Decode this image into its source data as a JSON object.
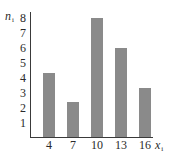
{
  "chart_data": {
    "type": "bar",
    "title": "",
    "xlabel": "x_i",
    "ylabel": "n_i",
    "categories": [
      "4",
      "7",
      "10",
      "13",
      "16"
    ],
    "values": [
      4.3,
      2.4,
      8,
      6,
      3.3
    ],
    "yticks": [
      "1",
      "2",
      "3",
      "4",
      "5",
      "6",
      "7",
      "8"
    ],
    "ylim": [
      0,
      8
    ],
    "grid": false,
    "legend": null,
    "bar_color": "#8a8a8a"
  },
  "labels": {
    "ylabel_main": "n",
    "ylabel_sub": "i",
    "xlabel_main": "x",
    "xlabel_sub": "i"
  }
}
